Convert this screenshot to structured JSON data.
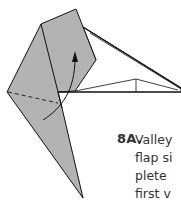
{
  "diagram": {
    "colors": {
      "paper_fill": "#b3b3b3",
      "outline": "#111111",
      "background": "#ffffff"
    },
    "elements": [
      "folded-paper-shape",
      "valley-fold-dashed-line",
      "fold-arrow"
    ]
  },
  "instruction": {
    "step_number": "8A.",
    "lines": [
      "Valley",
      "flap si",
      "plete",
      "first v"
    ]
  }
}
